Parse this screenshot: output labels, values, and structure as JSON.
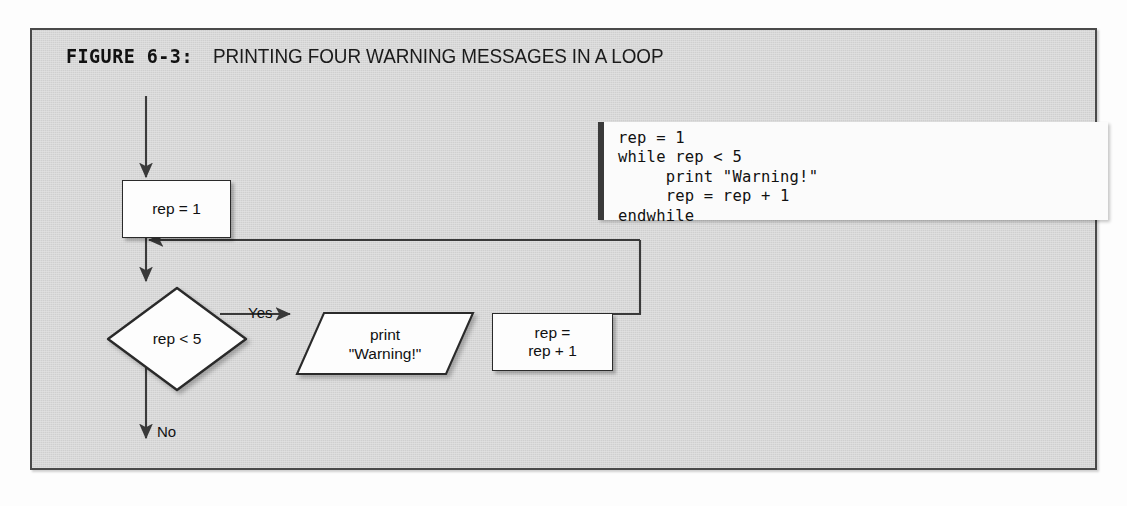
{
  "figure": {
    "label": "FIGURE 6-3:",
    "title": "PRINTING FOUR WARNING MESSAGES IN A LOOP"
  },
  "code": {
    "language": "pseudocode",
    "lines": [
      "rep = 1",
      "while rep < 5",
      "     print \"Warning!\"",
      "     rep = rep + 1",
      "endwhile"
    ],
    "text": "rep = 1\nwhile rep < 5\n     print \"Warning!\"\n     rep = rep + 1\nendwhile"
  },
  "flowchart": {
    "nodes": {
      "init": {
        "type": "process",
        "text": "rep = 1"
      },
      "decision": {
        "type": "decision",
        "text": "rep < 5"
      },
      "output": {
        "type": "output",
        "line1": "print",
        "line2": "\"Warning!\""
      },
      "increment": {
        "type": "process",
        "line1": "rep =",
        "line2": "rep + 1"
      }
    },
    "edges": {
      "yes_label": "Yes",
      "no_label": "No"
    }
  },
  "colors": {
    "figure_background": "#d5d5d5",
    "frame_border": "#4a4a4a",
    "shape_fill": "#fdfdfd",
    "shape_border": "#2a2a2a",
    "connector": "#3a3a3a",
    "code_background": "#fbfbfb",
    "code_accent_bar": "#3a3a3a",
    "text": "#111111"
  }
}
